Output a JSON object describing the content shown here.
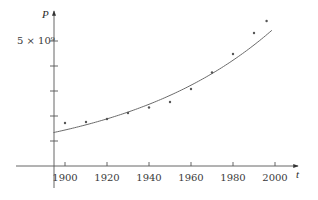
{
  "chart_data": {
    "type": "scatter",
    "title": "",
    "xlabel": "t",
    "ylabel": "P",
    "xlim": [
      1875,
      2010
    ],
    "ylim": [
      0,
      6200000000.0
    ],
    "grid": false,
    "legend": null,
    "x_ticks": [
      1900,
      1920,
      1940,
      1960,
      1980,
      2000
    ],
    "x_tick_labels": [
      "1900",
      "1920",
      "1940",
      "1960",
      "1980",
      "2000"
    ],
    "y_ticks": [
      1000000000.0,
      2000000000.0,
      3000000000.0,
      4000000000.0,
      5000000000.0
    ],
    "y_tick_labels": [
      "",
      "",
      "",
      "",
      "5 × 10⁹"
    ],
    "series": [
      {
        "name": "population data",
        "kind": "scatter",
        "x": [
          1900,
          1910,
          1920,
          1930,
          1940,
          1950,
          1960,
          1970,
          1980,
          1990,
          1996
        ],
        "values": [
          1720000000.0,
          1760000000.0,
          1880000000.0,
          2120000000.0,
          2340000000.0,
          2560000000.0,
          3080000000.0,
          3740000000.0,
          4480000000.0,
          5320000000.0,
          5800000000.0
        ]
      },
      {
        "name": "exponential model",
        "kind": "line",
        "formula": "P = 1.44e9 * exp(0.01347 * (t - 1900))",
        "x_range": [
          1894.5,
          1999
        ]
      }
    ]
  },
  "labels": {
    "y_axis": "P",
    "x_axis": "t",
    "y_tick_top": "5 × 10⁹",
    "x_ticks": [
      "1900",
      "1920",
      "1940",
      "1960",
      "1980",
      "2000"
    ]
  }
}
